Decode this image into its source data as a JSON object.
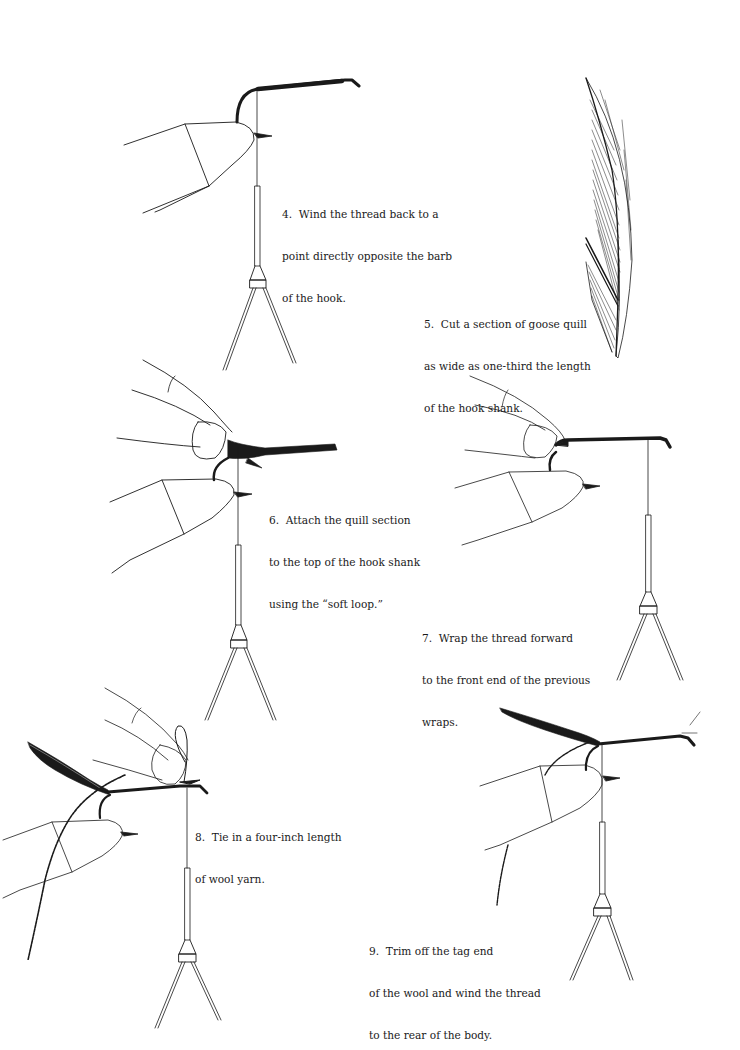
{
  "steps": [
    {
      "number": "4",
      "lines": [
        "4.  Wind the thread back to a",
        "point directly opposite the barb",
        "of the hook."
      ],
      "illustration": "hook-in-vise-thread-wound-back"
    },
    {
      "number": "5",
      "lines": [
        "5.  Cut a section of goose quill",
        "as wide as one-third the length",
        "of the hook shank."
      ],
      "illustration": "goose-quill-feather"
    },
    {
      "number": "6",
      "lines": [
        "6.  Attach the quill section",
        "to the top of the hook shank",
        "using the “soft loop.”"
      ],
      "illustration": "fingers-pinching-quill-on-hook"
    },
    {
      "number": "7",
      "lines": [
        "7.  Wrap the thread forward",
        "to the front end of the previous",
        "wraps."
      ],
      "illustration": "fingers-holding-wrapped-hook"
    },
    {
      "number": "8",
      "lines": [
        "8.  Tie in a four-inch length",
        "of wool yarn."
      ],
      "illustration": "tying-in-wool-yarn"
    },
    {
      "number": "9",
      "lines": [
        "9.  Trim off the tag end",
        "of the wool and wind the thread",
        "to the rear of the body."
      ],
      "illustration": "trimmed-wool-thread-to-rear"
    }
  ],
  "colors": {
    "ink": "#1a1a1a",
    "paper": "#ffffff"
  }
}
